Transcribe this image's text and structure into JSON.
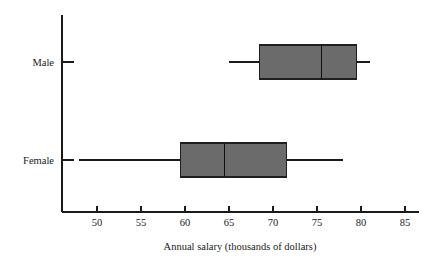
{
  "chart_data": {
    "type": "box",
    "title": "",
    "xlabel": "Annual salary (thousands of dollars)",
    "ylabel": "",
    "orientation": "horizontal",
    "grid": false,
    "legend": false,
    "xlim": [
      46.5,
      86
    ],
    "xticks": [
      50,
      55,
      60,
      65,
      70,
      75,
      80,
      85
    ],
    "xticklabels": [
      "50",
      "55",
      "60",
      "65",
      "70",
      "75",
      "80",
      "85"
    ],
    "categories": [
      "Male",
      "Female"
    ],
    "boxes": [
      {
        "category": "Male",
        "whisker_low": 65,
        "q1": 68.5,
        "median": 75.5,
        "q3": 79.5,
        "whisker_high": 81,
        "fill_color": "#6b6b6b",
        "edge_color": "#1f1f1f"
      },
      {
        "category": "Female",
        "whisker_low": 48,
        "q1": 59.5,
        "median": 64.5,
        "q3": 71.5,
        "whisker_high": 78,
        "fill_color": "#6b6b6b",
        "edge_color": "#1f1f1f"
      }
    ]
  },
  "colors": {
    "background": "#ffffff",
    "axis": "#1a1a1a",
    "box_fill": "#6b6b6b",
    "box_edge": "#1f1f1f",
    "median": "#111111"
  }
}
